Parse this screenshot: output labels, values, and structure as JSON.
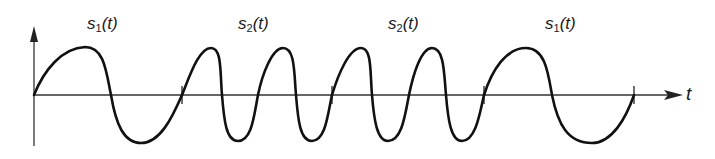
{
  "diagram": {
    "title": "",
    "axis": {
      "x_label": "t",
      "y_label": ""
    },
    "segments": [
      {
        "label_base": "s",
        "label_sub": "1",
        "label_arg": "(t)",
        "signal": "s1(t)",
        "cycles": 1
      },
      {
        "label_base": "s",
        "label_sub": "2",
        "label_arg": "(t)",
        "signal": "s2(t)",
        "cycles": 2
      },
      {
        "label_base": "s",
        "label_sub": "2",
        "label_arg": "(t)",
        "signal": "s2(t)",
        "cycles": 2
      },
      {
        "label_base": "s",
        "label_sub": "1",
        "label_arg": "(t)",
        "signal": "s1(t)",
        "cycles": 1
      }
    ],
    "colors": {
      "waveform": "#111111",
      "axis": "#333333",
      "background": "#ffffff"
    }
  }
}
